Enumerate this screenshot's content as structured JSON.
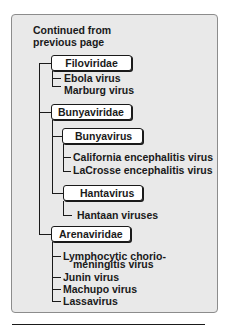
{
  "diagram": {
    "heading": "Continued from\nprevious page",
    "families": [
      {
        "name": "Filoviridae",
        "children": [
          "Ebola virus",
          "Marburg virus"
        ]
      },
      {
        "name": "Bunyaviridae",
        "genera": [
          {
            "name": "Bunyavirus",
            "children": [
              "California encephalitis virus",
              "LaCrosse encephalitis virus"
            ]
          },
          {
            "name": "Hantavirus",
            "children": [
              "Hantaan viruses"
            ]
          }
        ]
      },
      {
        "name": "Arenaviridae",
        "children": [
          "Lymphocytic chorio-",
          "meningitis virus",
          "Junin virus",
          "Machupo virus",
          "Lassavirus"
        ]
      }
    ]
  },
  "colors": {
    "panel_background": "#e9e9e9",
    "panel_border": "#8c8c8c",
    "node_background": "#ffffff",
    "line": "#1a1a1a"
  }
}
